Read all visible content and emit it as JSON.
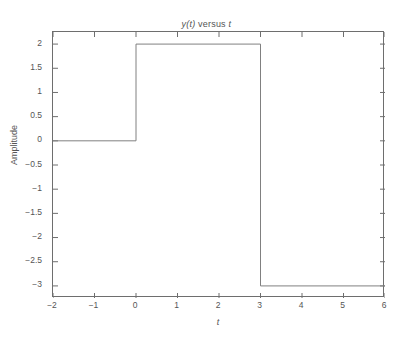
{
  "figure": {
    "background_color": "#ffffff",
    "axes_color": "#6e6e6e",
    "text_color": "#555555",
    "line_color": "#808080"
  },
  "title": {
    "full": "y(t) versus t",
    "part_italic_1": "y(t)",
    "part_plain": " versus ",
    "part_italic_2": "t"
  },
  "axes": {
    "xlabel": "t",
    "ylabel": "Amplitude"
  },
  "ticks": {
    "x": [
      "−2",
      "−1",
      "0",
      "1",
      "2",
      "3",
      "4",
      "5",
      "6"
    ],
    "y": [
      "2",
      "1.5",
      "1",
      "0.5",
      "0",
      "−0.5",
      "−1",
      "−1.5",
      "−2",
      "−2.5",
      "−3"
    ]
  },
  "chart_data": {
    "type": "line",
    "title": "y(t) versus t",
    "xlabel": "t",
    "ylabel": "Amplitude",
    "xlim": [
      -2,
      6
    ],
    "ylim": [
      -3.25,
      2.25
    ],
    "xticks": [
      -2,
      -1,
      0,
      1,
      2,
      3,
      4,
      5,
      6
    ],
    "yticks": [
      2,
      1.5,
      1,
      0.5,
      0,
      -0.5,
      -1,
      -1.5,
      -2,
      -2.5,
      -3
    ],
    "grid": false,
    "legend": null,
    "series": [
      {
        "name": "y(t)",
        "color": "#808080",
        "linewidth": 1,
        "description": "Piecewise-constant step signal with jumps at t=0 and t=3",
        "x": [
          -2,
          0,
          0,
          3,
          3,
          6
        ],
        "y": [
          0,
          0,
          2,
          2,
          -3,
          -3
        ]
      }
    ],
    "segments": [
      {
        "t_start": -2,
        "t_end": 0,
        "value": 0
      },
      {
        "t_start": 0,
        "t_end": 3,
        "value": 2
      },
      {
        "t_start": 3,
        "t_end": 6,
        "value": -3
      }
    ]
  }
}
